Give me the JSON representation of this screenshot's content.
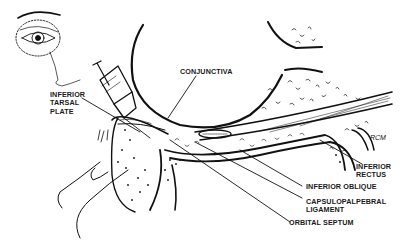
{
  "figure": {
    "ink_color": "#111111",
    "background": "#ffffff"
  },
  "labels": [
    {
      "id": "conjunctiva",
      "text": "CONJUNCTIVA"
    },
    {
      "id": "inferior_tarsal_plate",
      "text": "INFERIOR\nTARSAL\nPLATE"
    },
    {
      "id": "inferior_rectus",
      "text": "INFERIOR\nRECTUS"
    },
    {
      "id": "inferior_oblique",
      "text": "INFERIOR OBLIQUE"
    },
    {
      "id": "capsulopalpebral_ligament",
      "text": "CAPSULOPALPEBRAL\nLIGAMENT"
    },
    {
      "id": "orbital_septum",
      "text": "ORBITAL SEPTUM"
    }
  ],
  "signature": "RCM",
  "icons": {
    "inset": "eye-face-inset-icon",
    "syringe": "syringe-icon",
    "finger": "finger-icon"
  }
}
